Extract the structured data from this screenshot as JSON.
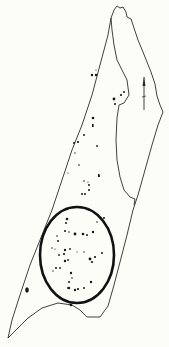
{
  "diagram": {
    "kind": "site-plan-sketch",
    "background": "#fdfdf8",
    "ink": "#1a1a1a",
    "labels": [],
    "north_arrow": {
      "x": 144,
      "y1": 76,
      "y2": 110
    },
    "highlight_ellipse": {
      "cx": 77,
      "cy": 255,
      "rx": 37,
      "ry": 48,
      "stroke_width": 2.6
    },
    "features_count": 60
  }
}
